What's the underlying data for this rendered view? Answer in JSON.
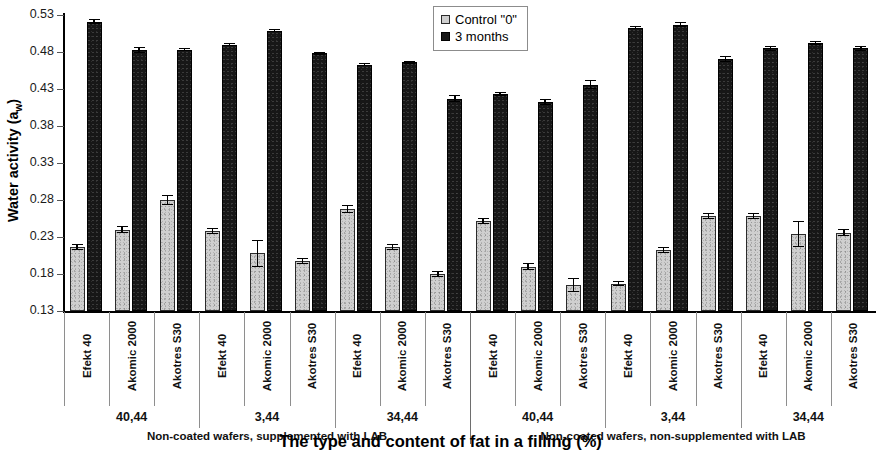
{
  "chart_data": {
    "type": "bar",
    "title": "",
    "xlabel": "The type and content of fat in a filling (%)",
    "ylabel": "Water activity (a",
    "ylabel_sub": "w",
    "ylabel_suffix": ")",
    "ylim": [
      0.13,
      0.53
    ],
    "yticks": [
      0.53,
      0.48,
      0.43,
      0.38,
      0.33,
      0.28,
      0.23,
      0.18,
      0.13
    ],
    "ytick_labels": [
      "0.53",
      "0.48",
      "0.43",
      "0.38",
      "0.33",
      "0.28",
      "0.23",
      "0.18",
      "0.13"
    ],
    "grid": false,
    "legend_position": "top-center",
    "legend": [
      {
        "name": "Control \"0\"",
        "color": "#cfcfcf",
        "key": "control"
      },
      {
        "name": "3 months",
        "color": "#171717",
        "key": "months"
      }
    ],
    "categories": [
      "Efekt 40",
      "Akomic 2000",
      "Akotres S30",
      "Efekt 40",
      "Akomic 2000",
      "Akotres S30",
      "Efekt 40",
      "Akomic 2000",
      "Akotres S30",
      "Efekt 40",
      "Akomic 2000",
      "Akotres S30",
      "Efekt 40",
      "Akomic 2000",
      "Akotres S30",
      "Efekt 40",
      "Akomic 2000",
      "Akotres S30"
    ],
    "fat_groups": [
      {
        "label": "40,44",
        "span": 3
      },
      {
        "label": "3,44",
        "span": 3
      },
      {
        "label": "34,44",
        "span": 3
      },
      {
        "label": "40,44",
        "span": 3
      },
      {
        "label": "3,44",
        "span": 3
      },
      {
        "label": "34,44",
        "span": 3
      }
    ],
    "coating_groups": [
      {
        "label": "Non-coated wafers, supplemented with LAB",
        "span": 9
      },
      {
        "label": "Non-coated wafers, non-supplemented with LAB",
        "span": 9
      }
    ],
    "series": [
      {
        "name": "Control \"0\"",
        "key": "control",
        "values": [
          0.216,
          0.24,
          0.28,
          0.238,
          0.208,
          0.198,
          0.268,
          0.216,
          0.18,
          0.252,
          0.19,
          0.165,
          0.167,
          0.213,
          0.259,
          0.258,
          0.234,
          0.236
        ],
        "errors": [
          0.004,
          0.005,
          0.007,
          0.004,
          0.018,
          0.004,
          0.005,
          0.004,
          0.004,
          0.004,
          0.005,
          0.009,
          0.003,
          0.004,
          0.004,
          0.004,
          0.018,
          0.005
        ]
      },
      {
        "name": "3 months",
        "key": "months",
        "values": [
          0.521,
          0.483,
          0.483,
          0.49,
          0.509,
          0.478,
          0.463,
          0.466,
          0.417,
          0.423,
          0.412,
          0.436,
          0.513,
          0.517,
          0.47,
          0.485,
          0.492,
          0.485
        ],
        "errors": [
          0.003,
          0.004,
          0.002,
          0.002,
          0.002,
          0.002,
          0.002,
          0.002,
          0.005,
          0.003,
          0.004,
          0.006,
          0.002,
          0.003,
          0.004,
          0.003,
          0.003,
          0.003
        ]
      }
    ]
  }
}
